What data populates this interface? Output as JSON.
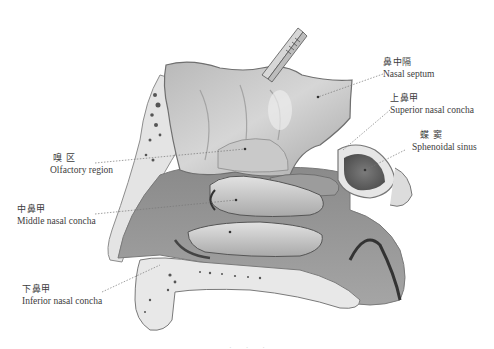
{
  "figure": {
    "style": "grayscale anatomical illustration",
    "labels": [
      {
        "id": "nasal-septum",
        "zh": "鼻中隔",
        "en": "Nasal septum"
      },
      {
        "id": "superior-nasal-concha",
        "zh": "上鼻甲",
        "en": "Superior nasal concha"
      },
      {
        "id": "sphenoidal-sinus",
        "zh": "蝶  窦",
        "en": "Sphenoidal sinus"
      },
      {
        "id": "olfactory-region",
        "zh": "嗅  区",
        "en": "Olfactory region"
      },
      {
        "id": "middle-nasal-concha",
        "zh": "中鼻甲",
        "en": "Middle nasal concha"
      },
      {
        "id": "inferior-nasal-concha",
        "zh": "下鼻甲",
        "en": "Inferior nasal concha"
      }
    ],
    "caption": "· · ·"
  }
}
